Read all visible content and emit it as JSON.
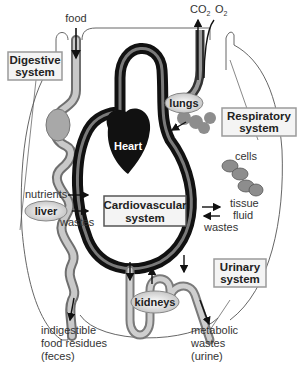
{
  "diagram": {
    "colors": {
      "tube_dark": "#1a1a1a",
      "tube_gray": "#8a8a8a",
      "organ_gray": "#9a9a9a",
      "box_fill": "#f4f4f4",
      "box_border": "#9a9a9a",
      "heart": "#111111",
      "body_outline": "#555555"
    },
    "inputs": {
      "food": "food",
      "co2": "CO",
      "co2_sub": "2",
      "o2": "O",
      "o2_sub": "2"
    },
    "systems": {
      "digestive": [
        "Digestive",
        "system"
      ],
      "respiratory": [
        "Respiratory",
        "system"
      ],
      "cardiovascular": [
        "Cardiovascular",
        "system"
      ],
      "urinary": [
        "Urinary",
        "system"
      ]
    },
    "organs": {
      "heart": "Heart",
      "lungs": "lungs",
      "liver": "liver",
      "kidneys": "kidneys",
      "cells": "cells"
    },
    "labels": {
      "nutrients": "nutrients",
      "wastes_left": "wastes",
      "tissue_fluid": [
        "tissue",
        "fluid"
      ],
      "wastes_right": "wastes"
    },
    "outputs": {
      "feces": [
        "indigestible",
        "food residues",
        "(feces)"
      ],
      "urine": [
        "metabolic",
        "wastes",
        "(urine)"
      ]
    }
  }
}
